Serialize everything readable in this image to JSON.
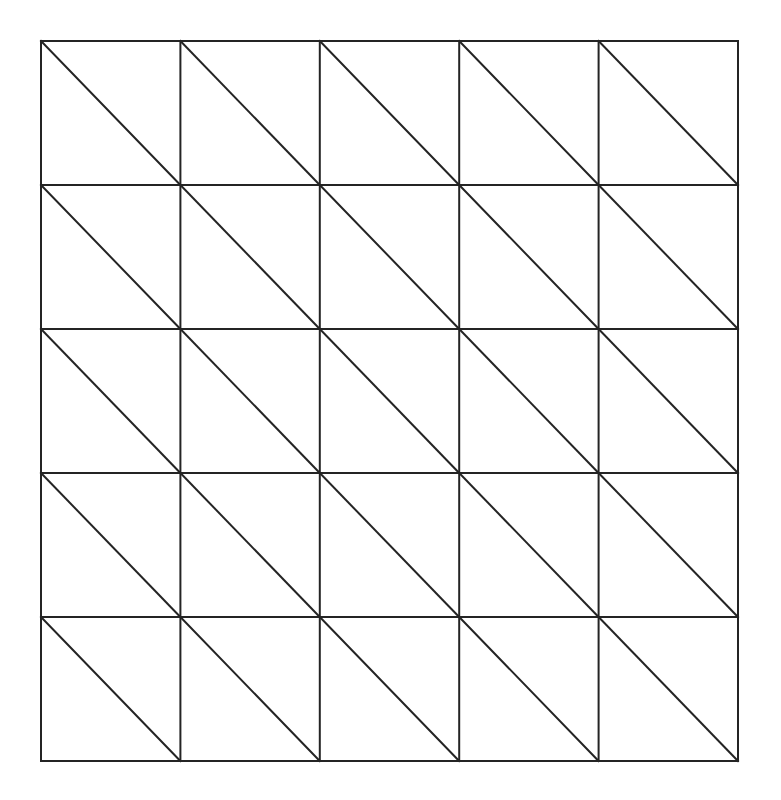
{
  "figure": {
    "background_color": "#ffffff",
    "grid": {
      "rows": 5,
      "cols": 5,
      "x": 41,
      "y": 41,
      "width": 697,
      "height": 720,
      "stroke_color": "#242424",
      "stroke_width": 2,
      "diagonal_direction": "top-left-to-bottom-right"
    },
    "canvas": {
      "width": 781,
      "height": 800
    }
  }
}
